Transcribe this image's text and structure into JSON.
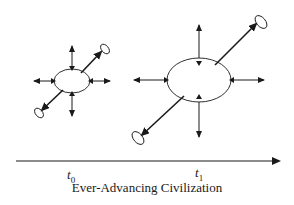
{
  "diagram": {
    "title": "Ever-Advancing Civilization",
    "stroke_color": "#1a1a1a",
    "stages": [
      {
        "id": "t0",
        "label_base": "t",
        "label_sub": "0",
        "center": [
          72,
          81
        ],
        "ellipse_rx": 18,
        "ellipse_ry": 12,
        "arrows": [
          "up",
          "down",
          "left",
          "right",
          "diagonal-up-right",
          "diagonal-down-left"
        ]
      },
      {
        "id": "t1",
        "label_base": "t",
        "label_sub": "1",
        "center": [
          199,
          80
        ],
        "ellipse_rx": 32,
        "ellipse_ry": 22,
        "arrows": [
          "up",
          "down",
          "left",
          "right",
          "diagonal-up-right",
          "diagonal-down-left"
        ]
      }
    ],
    "time_axis": {
      "direction": "right",
      "from_x": 16,
      "to_x": 280,
      "y": 161
    }
  }
}
